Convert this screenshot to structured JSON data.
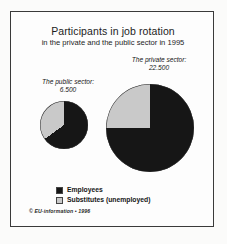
{
  "chart_data": {
    "type": "pie",
    "title": "Participants in job rotation",
    "subtitle": "in the private and the public sector in 1995",
    "legend_position": "bottom-left",
    "legend": [
      {
        "name": "Employees",
        "color": "#161616",
        "swatch": "black"
      },
      {
        "name": "Substitutes (unemployed)",
        "color": "#c9c9c9",
        "swatch": "gray"
      }
    ],
    "series": [
      {
        "name": "The public sector:",
        "total_label": "6.500",
        "total": 6500,
        "radius_px": 24,
        "slices": [
          {
            "label": "Employees",
            "percent": 65,
            "color": "#161616"
          },
          {
            "label": "Substitutes (unemployed)",
            "percent": 35,
            "color": "#c9c9c9"
          }
        ]
      },
      {
        "name": "The private sector:",
        "total_label": "22.500",
        "total": 22500,
        "radius_px": 44,
        "slices": [
          {
            "label": "Employees",
            "percent": 75,
            "color": "#161616"
          },
          {
            "label": "Substitutes (unemployed)",
            "percent": 25,
            "color": "#c9c9c9"
          }
        ]
      }
    ],
    "credit": "© EU-information • 1996"
  },
  "labels": {
    "public_sector_name": "The public sector:",
    "public_sector_value": "6.500",
    "private_sector_name": "The private sector:",
    "private_sector_value": "22.500"
  },
  "legend": {
    "employees": "Employees",
    "substitutes": "Substitutes (unemployed)"
  },
  "footer": {
    "credit": "© EU-information • 1996"
  }
}
